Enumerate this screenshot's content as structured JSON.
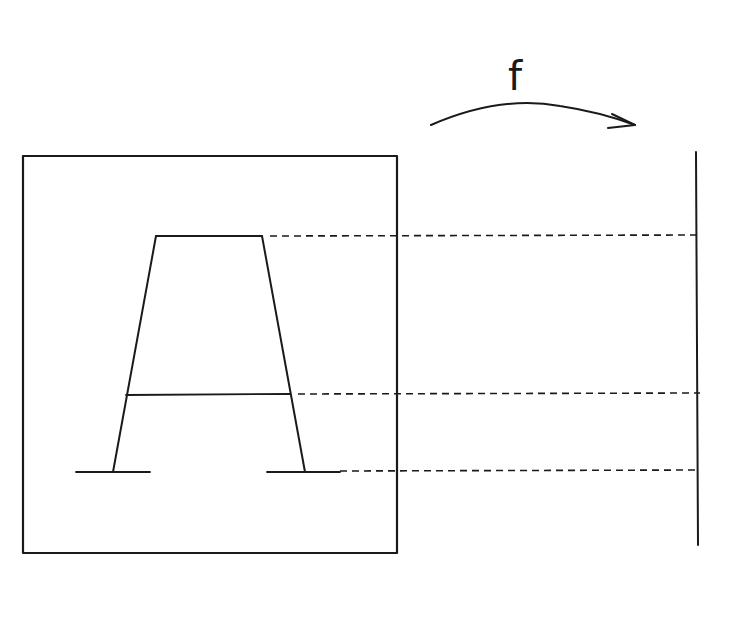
{
  "diagram": {
    "map_label": "f",
    "colors": {
      "ink": "#1a1a1a",
      "background": "#ffffff"
    },
    "domain_box": {
      "x1": 23,
      "y1": 156,
      "x2": 397,
      "y2": 553
    },
    "letter_A": {
      "top_bar": {
        "x1": 156,
        "x2": 262,
        "y": 236
      },
      "crossbar": {
        "x1": 126,
        "x2": 290,
        "y": 395
      },
      "left_leg": {
        "top_x": 156,
        "top_y": 236,
        "bottom_x": 113,
        "bottom_y": 472
      },
      "right_leg": {
        "top_x": 262,
        "top_y": 236,
        "bottom_x": 305,
        "bottom_y": 472
      },
      "left_serif": {
        "x1": 76,
        "x2": 150,
        "y": 472
      },
      "right_serif": {
        "x1": 267,
        "x2": 340,
        "y": 472
      }
    },
    "codomain_line": {
      "x": 697,
      "y1": 152,
      "y2": 545
    },
    "projection_lines": [
      {
        "name": "top",
        "x1": 270,
        "x2": 700,
        "y": 236
      },
      {
        "name": "crossbar",
        "x1": 298,
        "x2": 700,
        "y": 394
      },
      {
        "name": "base",
        "x1": 340,
        "x2": 700,
        "y": 471
      }
    ],
    "arrow": {
      "start_x": 431,
      "start_y": 125,
      "end_x": 635,
      "end_y": 126
    }
  }
}
